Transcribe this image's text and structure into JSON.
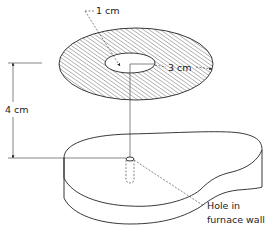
{
  "caption_fragment": "",
  "figure": {
    "title": "",
    "labels": {
      "inner_radius": "1 cm",
      "outer_annulus_width": "3 cm",
      "height": "4 cm",
      "hole_line1": "Hole in",
      "hole_line2": "furnace wall"
    },
    "components": [
      {
        "name": "hatched-annular-disk",
        "description": "Hatched annular disk (radiation shield / target)"
      },
      {
        "name": "central-hole",
        "description": "Inner hole of radius 1 cm"
      },
      {
        "name": "furnace-wall",
        "description": "Furnace wall block with hole"
      },
      {
        "name": "hole-in-furnace-wall",
        "description": "Small hole in furnace wall"
      }
    ],
    "dimensions": {
      "inner_radius_cm": 1,
      "annulus_width_cm": 3,
      "separation_cm": 4
    },
    "colors": {
      "ink": "#222222",
      "background": "#ffffff"
    }
  }
}
